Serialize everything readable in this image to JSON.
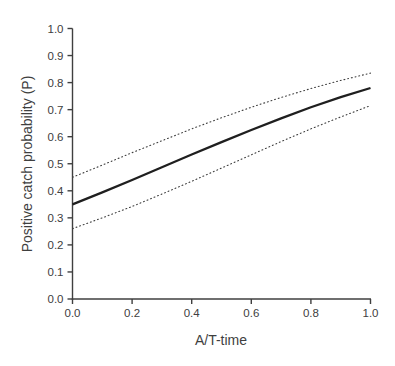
{
  "figure": {
    "background_color": "#ffffff",
    "axis_color": "#3f3f3f",
    "tick_label_color": "#404040",
    "axis_title_color": "#3f3f3f"
  },
  "chart_data": {
    "type": "line",
    "title": "",
    "xlabel": "A/T-time",
    "ylabel": "Positive catch probability (P)",
    "xlim": [
      0.0,
      1.0
    ],
    "ylim": [
      0.0,
      1.0
    ],
    "grid": false,
    "legend": "none",
    "x_tick_labels": [
      "0.0",
      "0.2",
      "0.4",
      "0.6",
      "0.8",
      "1.0"
    ],
    "y_tick_labels": [
      "0.0",
      "0.1",
      "0.2",
      "0.3",
      "0.4",
      "0.5",
      "0.6",
      "0.7",
      "0.8",
      "0.9",
      "1.0"
    ],
    "x": [
      0.0,
      0.1,
      0.2,
      0.3,
      0.4,
      0.5,
      0.6,
      0.7,
      0.8,
      0.9,
      1.0
    ],
    "series": [
      {
        "name": "predicted-probability",
        "style": "solid",
        "color": "#1f1f1f",
        "width": 2.3,
        "values": [
          0.35,
          0.394,
          0.44,
          0.487,
          0.534,
          0.58,
          0.625,
          0.668,
          0.709,
          0.746,
          0.78
        ]
      },
      {
        "name": "upper-confidence-bound",
        "style": "dotted",
        "color": "#3f3f3f",
        "width": 1.1,
        "values": [
          0.45,
          0.495,
          0.541,
          0.585,
          0.629,
          0.67,
          0.709,
          0.745,
          0.778,
          0.808,
          0.835
        ]
      },
      {
        "name": "lower-confidence-bound",
        "style": "dotted",
        "color": "#3f3f3f",
        "width": 1.1,
        "values": [
          0.26,
          0.3,
          0.342,
          0.388,
          0.435,
          0.484,
          0.533,
          0.582,
          0.629,
          0.673,
          0.715
        ]
      }
    ]
  }
}
